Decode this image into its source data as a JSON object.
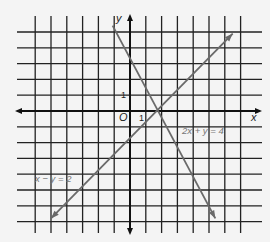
{
  "figure": {
    "type": "coordinate-plane-graph",
    "axes": {
      "x_label": "x",
      "y_label": "y",
      "origin_label": "O",
      "x_unit_label": "1",
      "y_unit_label": "1"
    },
    "grid": {
      "x_min": -6,
      "x_max": 7,
      "y_min": -7,
      "y_max": 5
    },
    "lines": [
      {
        "equation": "2x + y = 4",
        "label": "2x + y = 4",
        "from": [
          -1.1,
          5.4
        ],
        "to": [
          5.4,
          -6.8
        ],
        "color": "#6a6a6a"
      },
      {
        "equation": "x − y = 2",
        "label": "x − y = 2",
        "from": [
          -5,
          -6.8
        ],
        "to": [
          6.5,
          4.9
        ],
        "color": "#6a6a6a"
      }
    ],
    "intersection": [
      2,
      0
    ]
  }
}
